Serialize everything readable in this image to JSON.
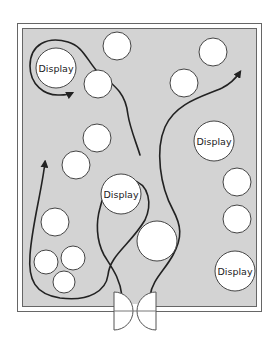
{
  "diagram": {
    "title": "",
    "colors": {
      "floor": "#d3d3d3",
      "wall": "#555555",
      "fixture_fill": "#ffffff",
      "fixture_stroke": "#444444",
      "path": "#222222"
    },
    "fixtures": [
      {
        "id": "display-top-left",
        "label": "Display",
        "cx": 56,
        "cy": 68,
        "r": 20
      },
      {
        "id": "fixture-1",
        "label": "",
        "cx": 117,
        "cy": 46,
        "r": 14
      },
      {
        "id": "fixture-2",
        "label": "",
        "cx": 98,
        "cy": 84,
        "r": 14
      },
      {
        "id": "fixture-3",
        "label": "",
        "cx": 97,
        "cy": 138,
        "r": 14
      },
      {
        "id": "fixture-4",
        "label": "",
        "cx": 76,
        "cy": 165,
        "r": 14
      },
      {
        "id": "display-center",
        "label": "Display",
        "cx": 121,
        "cy": 194,
        "r": 20
      },
      {
        "id": "fixture-5",
        "label": "",
        "cx": 213,
        "cy": 52,
        "r": 14
      },
      {
        "id": "fixture-6",
        "label": "",
        "cx": 184,
        "cy": 83,
        "r": 14
      },
      {
        "id": "display-right",
        "label": "Display",
        "cx": 214,
        "cy": 141,
        "r": 20
      },
      {
        "id": "fixture-7",
        "label": "",
        "cx": 237,
        "cy": 182,
        "r": 14
      },
      {
        "id": "fixture-8",
        "label": "",
        "cx": 237,
        "cy": 219,
        "r": 14
      },
      {
        "id": "display-bottom-right",
        "label": "Display",
        "cx": 235,
        "cy": 271,
        "r": 20
      },
      {
        "id": "fixture-large",
        "label": "",
        "cx": 157,
        "cy": 241,
        "r": 20
      },
      {
        "id": "fixture-9",
        "label": "",
        "cx": 55,
        "cy": 222,
        "r": 14
      },
      {
        "id": "fixture-10",
        "label": "",
        "cx": 46,
        "cy": 262,
        "r": 12
      },
      {
        "id": "fixture-11",
        "label": "",
        "cx": 73,
        "cy": 258,
        "r": 12
      },
      {
        "id": "fixture-12",
        "label": "",
        "cx": 64,
        "cy": 282,
        "r": 11
      }
    ],
    "paths": [
      {
        "id": "path-entry-loop",
        "d": "M 122 296 C 120 278, 112 268, 104 255 C 96 240, 96 222, 100 208 C 104 188, 120 178, 132 180 C 150 184, 152 205, 145 220 C 130 245, 110 255, 108 275 C 106 290, 90 302, 60 298 C 35 294, 28 280, 30 255 C 32 225, 42 190, 45 162",
        "arrow_end": true
      },
      {
        "id": "path-exit-right",
        "d": "M 150 296 C 152 280, 165 270, 173 255 C 183 237, 181 225, 173 210 C 160 186, 155 150, 165 127 C 176 102, 205 96, 222 88 C 230 84, 236 78, 240 72",
        "arrow_end": true
      },
      {
        "id": "path-top-left-loop",
        "d": "M 140 155 C 136 142, 130 128, 128 115 C 126 95, 118 88, 96 70 C 86 58, 82 46, 68 42 C 48 36, 30 44, 30 66 C 30 84, 44 96, 60 95 C 66 95, 70 94, 72 93",
        "arrow_end": true
      }
    ],
    "door": {
      "label": "",
      "left_panel_x": 116,
      "right_panel_x": 151,
      "y_top": 292,
      "y_bottom": 330
    }
  }
}
